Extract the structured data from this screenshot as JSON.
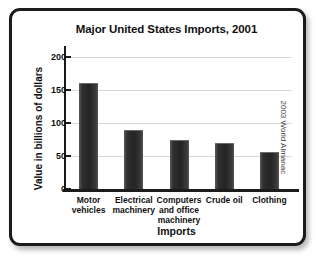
{
  "chart_data": {
    "type": "bar",
    "title": "Major United States Imports, 2001",
    "xlabel": "Imports",
    "ylabel": "Value in billions of dollars",
    "categories": [
      "Motor vehicles",
      "Electrical machinery",
      "Computers and office machinery",
      "Crude oil",
      "Clothing"
    ],
    "category_lines": [
      [
        "Motor",
        "vehicles"
      ],
      [
        "Electrical",
        "machinery"
      ],
      [
        "Computers",
        "and office",
        "machinery"
      ],
      [
        "Crude oil"
      ],
      [
        "Clothing"
      ]
    ],
    "values": [
      160,
      90,
      74,
      69,
      56
    ],
    "ylim": [
      0,
      215
    ],
    "yticks": [
      0,
      50,
      100,
      150,
      200
    ],
    "ytick_labels": [
      "0",
      "50",
      "100",
      "150",
      "200"
    ],
    "grid": true,
    "legend": "none",
    "bar_color": "#2a2a2a",
    "gridline_color": "#d8d8d8",
    "axis_color": "#1b1b1b"
  },
  "source": {
    "credit": "2003 World Almanac"
  }
}
